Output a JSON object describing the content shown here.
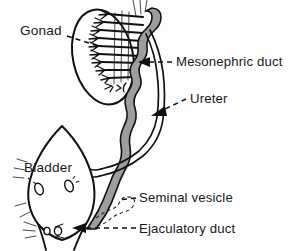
{
  "figure": {
    "type": "anatomical-line-drawing",
    "style": "black ink line drawing with gray-shaded duct, dashed leader lines",
    "width": 299,
    "height": 251,
    "background_color": "#fdfdfd",
    "ink_color": "#111111",
    "duct_shade_color": "#9d9d9d"
  },
  "labels": {
    "gonad": "Gonad",
    "mesonephric_duct": "Mesonephric duct",
    "ureter": "Ureter",
    "bladder": "Bladder",
    "seminal_vesicle": "Seminal vesicle",
    "ejaculatory_duct": "Ejaculatory duct"
  },
  "label_positions": {
    "gonad": {
      "x": 20,
      "y": 35,
      "anchor": "start"
    },
    "mesonephric_duct": {
      "x": 176,
      "y": 66,
      "anchor": "start"
    },
    "ureter": {
      "x": 190,
      "y": 103,
      "anchor": "start"
    },
    "bladder": {
      "x": 24,
      "y": 172,
      "anchor": "start"
    },
    "seminal_vesicle": {
      "x": 139,
      "y": 202,
      "anchor": "start"
    },
    "ejaculatory_duct": {
      "x": 139,
      "y": 233,
      "anchor": "start"
    }
  },
  "structures": [
    {
      "name": "gonad",
      "description": "large ellipse tilted left of the mesonephric tubules"
    },
    {
      "name": "mesonephric-tubules",
      "description": "comb-like branching tubules draining into the duct"
    },
    {
      "name": "mesonephric-duct",
      "description": "wavy gray-filled duct running from top down to the urogenital sinus"
    },
    {
      "name": "ureter",
      "description": "thin paired line branching from the duct and curving to the bladder"
    },
    {
      "name": "bladder",
      "description": "large pointed-oval sac at lower left with hatched wall"
    },
    {
      "name": "bladder-openings",
      "description": "two small oval orifices inside the bladder"
    },
    {
      "name": "seminal-vesicle",
      "description": "small irregular dashed outgrowth near the duct terminus"
    },
    {
      "name": "ejaculatory-duct",
      "description": "terminal segment of the duct entering the urethra"
    },
    {
      "name": "urethral-outlet",
      "description": "small openings at the bladder neck"
    }
  ]
}
